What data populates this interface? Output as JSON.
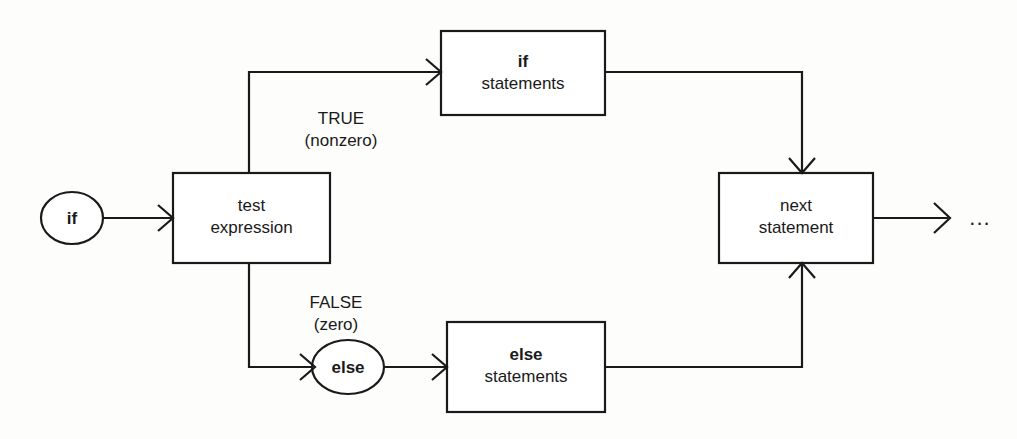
{
  "diagram": {
    "background_color": "#fdfdfc",
    "stroke_color": "#1a1a1a",
    "nodes": {
      "if_entry": {
        "label": "if",
        "shape": "ellipse"
      },
      "test_expression": {
        "line1": "test",
        "line2": "expression",
        "shape": "rectangle"
      },
      "if_statements": {
        "line1": "if",
        "line2": "statements",
        "shape": "rectangle"
      },
      "else_entry": {
        "label": "else",
        "shape": "ellipse"
      },
      "else_statements": {
        "line1": "else",
        "line2": "statements",
        "shape": "rectangle"
      },
      "next_statement": {
        "line1": "next",
        "line2": "statement",
        "shape": "rectangle"
      }
    },
    "branch_labels": {
      "true_branch": {
        "line1": "TRUE",
        "line2": "(nonzero)"
      },
      "false_branch": {
        "line1": "FALSE",
        "line2": "(zero)"
      }
    },
    "continuation": {
      "label": "..."
    },
    "edges": [
      {
        "name": "if-entry-to-test",
        "from": "if_entry",
        "to": "test_expression",
        "arrow": true
      },
      {
        "name": "test-to-if-statements",
        "from": "test_expression",
        "to": "if_statements",
        "label": "TRUE (nonzero)",
        "arrow": true
      },
      {
        "name": "test-to-else-entry",
        "from": "test_expression",
        "to": "else_entry",
        "label": "FALSE (zero)",
        "arrow": true
      },
      {
        "name": "else-entry-to-else-statements",
        "from": "else_entry",
        "to": "else_statements",
        "arrow": true
      },
      {
        "name": "if-statements-to-next",
        "from": "if_statements",
        "to": "next_statement",
        "arrow": true
      },
      {
        "name": "else-statements-to-next",
        "from": "else_statements",
        "to": "next_statement",
        "arrow": true
      },
      {
        "name": "next-to-continuation",
        "from": "next_statement",
        "to": "continuation",
        "arrow": true
      }
    ]
  }
}
